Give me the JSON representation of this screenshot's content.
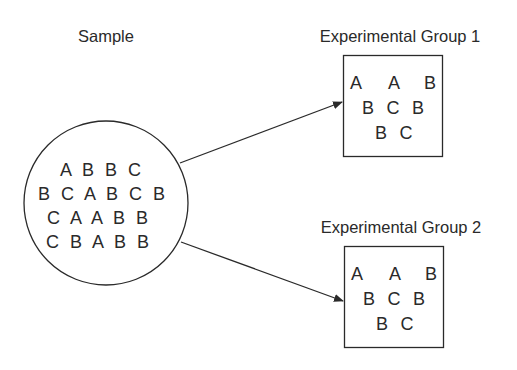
{
  "sample": {
    "title": "Sample",
    "rows": [
      "A B B C",
      "B C A B C B",
      "C A A B B",
      "C B A B B"
    ]
  },
  "groups": [
    {
      "title": "Experimental Group 1",
      "letters": [
        {
          "t": "A",
          "x": 356,
          "y": 89
        },
        {
          "t": "A",
          "x": 394,
          "y": 89
        },
        {
          "t": "B",
          "x": 430,
          "y": 89
        },
        {
          "t": "B",
          "x": 368,
          "y": 114
        },
        {
          "t": "C",
          "x": 393,
          "y": 114
        },
        {
          "t": "B",
          "x": 418,
          "y": 114
        },
        {
          "t": "B",
          "x": 381,
          "y": 139
        },
        {
          "t": "C",
          "x": 406,
          "y": 139
        }
      ]
    },
    {
      "title": "Experimental Group 2",
      "letters": [
        {
          "t": "A",
          "x": 357,
          "y": 280
        },
        {
          "t": "A",
          "x": 395,
          "y": 280
        },
        {
          "t": "B",
          "x": 431,
          "y": 280
        },
        {
          "t": "B",
          "x": 369,
          "y": 305
        },
        {
          "t": "C",
          "x": 394,
          "y": 305
        },
        {
          "t": "B",
          "x": 419,
          "y": 305
        },
        {
          "t": "B",
          "x": 382,
          "y": 330
        },
        {
          "t": "C",
          "x": 407,
          "y": 330
        }
      ]
    }
  ],
  "colors": {
    "stroke": "#2a2a2a",
    "text": "#2a2a2a",
    "background": "#ffffff"
  }
}
